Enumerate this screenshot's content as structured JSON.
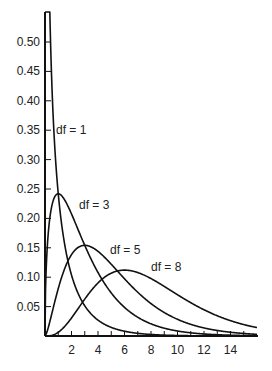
{
  "chart_data": {
    "type": "line",
    "title": "",
    "xlabel": "",
    "ylabel": "",
    "xlim": [
      0,
      16
    ],
    "ylim": [
      0,
      0.52
    ],
    "grid": false,
    "legend": "inline curve labels",
    "x_ticks": [
      2,
      4,
      6,
      8,
      10,
      12,
      14
    ],
    "x_minor_ticks": [
      1,
      3,
      5,
      7,
      9,
      11,
      13,
      15
    ],
    "y_ticks": [
      0.05,
      0.1,
      0.15,
      0.2,
      0.25,
      0.3,
      0.35,
      0.4,
      0.45,
      0.5
    ],
    "y_tick_labels": [
      "0.05",
      "0.10",
      "0.15",
      "0.20",
      "0.25",
      "0.30",
      "0.35",
      "0.40",
      "0.45",
      "0.50"
    ],
    "x_tick_labels": [
      "2",
      "4",
      "6",
      "8",
      "10",
      "12",
      "14"
    ],
    "distribution": "chi-square probability density",
    "series": [
      {
        "name": "df = 1",
        "df": 1,
        "label": "df = 1",
        "label_pos": [
          56,
          134
        ],
        "x": [
          0.05,
          0.5,
          1,
          2,
          3,
          4,
          6,
          8,
          10,
          12,
          14,
          16
        ],
        "values": [
          1.72,
          0.44,
          0.24,
          0.1,
          0.05,
          0.03,
          0.01,
          0.005,
          0.002,
          0.001,
          0.0005,
          0.0002
        ]
      },
      {
        "name": "df = 3",
        "df": 3,
        "label": "df = 3",
        "label_pos": [
          79,
          209
        ],
        "x": [
          0,
          0.5,
          1,
          2,
          3,
          4,
          6,
          8,
          10,
          12,
          14,
          16
        ],
        "values": [
          0,
          0.22,
          0.24,
          0.21,
          0.15,
          0.11,
          0.05,
          0.02,
          0.008,
          0.003,
          0.001,
          0.0005
        ]
      },
      {
        "name": "df = 5",
        "df": 5,
        "label": "df = 5",
        "label_pos": [
          110,
          254
        ],
        "x": [
          0,
          1,
          2,
          3,
          4,
          6,
          8,
          10,
          12,
          14,
          16
        ],
        "values": [
          0,
          0.08,
          0.14,
          0.15,
          0.14,
          0.1,
          0.05,
          0.03,
          0.01,
          0.005,
          0.002
        ]
      },
      {
        "name": "df = 8",
        "df": 8,
        "label": "df = 8",
        "label_pos": [
          151,
          271
        ],
        "x": [
          0,
          2,
          4,
          6,
          8,
          10,
          12,
          14,
          16
        ],
        "values": [
          0,
          0.04,
          0.09,
          0.11,
          0.1,
          0.08,
          0.05,
          0.03,
          0.02
        ]
      }
    ]
  }
}
